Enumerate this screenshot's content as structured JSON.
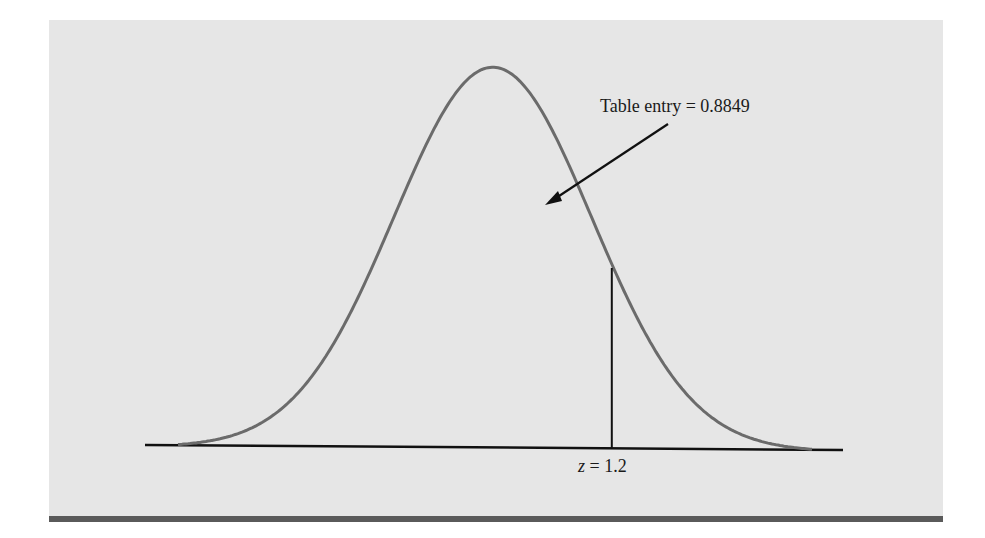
{
  "chart_data": {
    "type": "area",
    "title": "",
    "xlabel": "",
    "ylabel": "",
    "distribution": "standard normal",
    "x_range": [
      -3.5,
      3.5
    ],
    "marked_z": 1.2,
    "shaded_region": "left of z = 1.2",
    "area_left_of_z": 0.8849,
    "annotations": [
      {
        "text": "Table entry = 0.8849",
        "points_to": "area under curve left of z"
      },
      {
        "text": "z = 1.2",
        "position": "below axis at z"
      }
    ],
    "grid": false,
    "legend": null
  },
  "labels": {
    "table_entry": "Table entry = 0.8849",
    "z_var": "z",
    "z_eq": " = 1.2"
  },
  "colors": {
    "panel": "#e6e6e6",
    "curve": "#6b6b6b",
    "axis": "#111111",
    "rule": "#5a5a5a"
  }
}
